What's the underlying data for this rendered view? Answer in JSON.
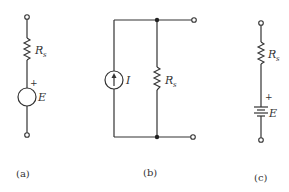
{
  "figure": {
    "panels": [
      {
        "id": "a",
        "caption": "(a)",
        "description": "Voltage source E in series with source resistance Rs",
        "resistor": {
          "label": "R",
          "subscript": "s"
        },
        "source": {
          "type": "voltage-source",
          "label": "E",
          "polarity_mark": "+"
        }
      },
      {
        "id": "b",
        "caption": "(b)",
        "description": "Current source I in parallel with source resistance Rs",
        "source": {
          "type": "current-source",
          "label": "I"
        },
        "resistor": {
          "label": "R",
          "subscript": "s"
        }
      },
      {
        "id": "c",
        "caption": "(c)",
        "description": "Battery E in series with source resistance Rs",
        "resistor": {
          "label": "R",
          "subscript": "s"
        },
        "source": {
          "type": "battery",
          "label": "E",
          "polarity_mark": "+"
        }
      }
    ]
  }
}
